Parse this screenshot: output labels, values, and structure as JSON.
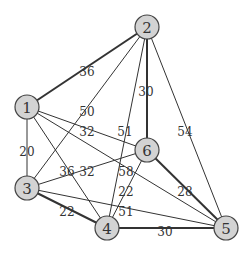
{
  "graph": {
    "nodes": [
      {
        "id": "1",
        "label": "1",
        "x": 27,
        "y": 107
      },
      {
        "id": "2",
        "label": "2",
        "x": 147,
        "y": 27
      },
      {
        "id": "3",
        "label": "3",
        "x": 27,
        "y": 188
      },
      {
        "id": "4",
        "label": "4",
        "x": 107,
        "y": 228
      },
      {
        "id": "5",
        "label": "5",
        "x": 226,
        "y": 228
      },
      {
        "id": "6",
        "label": "6",
        "x": 147,
        "y": 150
      }
    ],
    "edges": [
      {
        "from": "1",
        "to": "2",
        "weight": "36",
        "bold": true,
        "lx": 87,
        "ly": 72
      },
      {
        "from": "2",
        "to": "3",
        "weight": "50",
        "bold": false,
        "lx": 87,
        "ly": 112
      },
      {
        "from": "2",
        "to": "4",
        "weight": "51",
        "bold": false,
        "lx": 125,
        "ly": 132
      },
      {
        "from": "2",
        "to": "6",
        "weight": "30",
        "bold": true,
        "lx": 146,
        "ly": 92
      },
      {
        "from": "2",
        "to": "5",
        "weight": "54",
        "bold": false,
        "lx": 185,
        "ly": 132
      },
      {
        "from": "1",
        "to": "3",
        "weight": "20",
        "bold": false,
        "lx": 27,
        "ly": 152
      },
      {
        "from": "1",
        "to": "6",
        "weight": "32",
        "bold": false,
        "lx": 87,
        "ly": 132
      },
      {
        "from": "1",
        "to": "4",
        "weight": "36",
        "bold": false,
        "lx": 67,
        "ly": 172
      },
      {
        "from": "1",
        "to": "5",
        "weight": "58",
        "bold": false,
        "lx": 126,
        "ly": 172
      },
      {
        "from": "3",
        "to": "6",
        "weight": "32",
        "bold": false,
        "lx": 87,
        "ly": 172
      },
      {
        "from": "6",
        "to": "4",
        "weight": "22",
        "bold": false,
        "lx": 126,
        "ly": 192
      },
      {
        "from": "3",
        "to": "4",
        "weight": "22",
        "bold": true,
        "lx": 67,
        "ly": 212
      },
      {
        "from": "3",
        "to": "5",
        "weight": "51",
        "bold": false,
        "lx": 126,
        "ly": 212
      },
      {
        "from": "6",
        "to": "5",
        "weight": "28",
        "bold": true,
        "lx": 185,
        "ly": 192
      },
      {
        "from": "4",
        "to": "5",
        "weight": "30",
        "bold": true,
        "lx": 165,
        "ly": 232
      }
    ]
  }
}
